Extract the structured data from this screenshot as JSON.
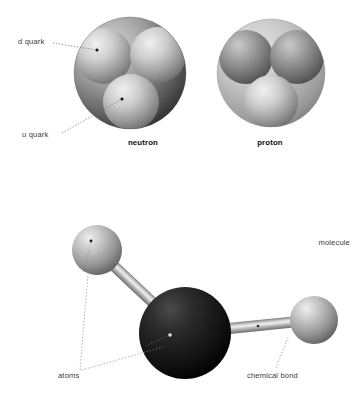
{
  "figure": {
    "background_color": "#ffffff",
    "label_color": "#3a3a3a"
  },
  "labels": {
    "d_quark": "d quark",
    "u_quark": "u quark",
    "neutron": "neutron",
    "proton": "proton",
    "molecule": "molecule",
    "atoms": "atoms",
    "chemical_bond": "chemical bond"
  },
  "diagram_data": {
    "type": "illustration",
    "panels": [
      {
        "name": "neutron",
        "caption": "neutron",
        "shell": {
          "cx": 130,
          "cy": 73,
          "r": 56,
          "fill": "#8f8f8f"
        },
        "quarks": [
          {
            "label": "d quark",
            "cx": 104,
            "cy": 56,
            "r": 27,
            "shade": "light"
          },
          {
            "label": "d quark",
            "cx": 157,
            "cy": 55,
            "r": 27,
            "shade": "light"
          },
          {
            "label": "u quark",
            "cx": 131,
            "cy": 101,
            "r": 27,
            "shade": "light"
          }
        ],
        "callouts": [
          {
            "text": "d quark",
            "dot": [
              97,
              50
            ]
          },
          {
            "text": "u quark",
            "dot": [
              122,
              99
            ]
          }
        ]
      },
      {
        "name": "proton",
        "caption": "proton",
        "shell": {
          "cx": 271,
          "cy": 73,
          "r": 54,
          "fill": "#a5a5a5"
        },
        "quarks": [
          {
            "label": "u quark",
            "cx": 246,
            "cy": 56,
            "r": 26,
            "shade": "dark"
          },
          {
            "label": "u quark",
            "cx": 297,
            "cy": 56,
            "r": 26,
            "shade": "dark"
          },
          {
            "label": "d quark",
            "cx": 271,
            "cy": 101,
            "r": 26,
            "shade": "light"
          }
        ],
        "callouts": []
      },
      {
        "name": "molecule",
        "caption": "molecule",
        "atoms": [
          {
            "cx": 97,
            "cy": 250,
            "r": 25,
            "shade": "gray",
            "marker": [
              91,
              241
            ]
          },
          {
            "cx": 185,
            "cy": 333,
            "r": 46,
            "shade": "black",
            "marker": [
              170,
              335
            ]
          },
          {
            "cx": 314,
            "cy": 320,
            "r": 24,
            "shade": "gray",
            "marker": null
          }
        ],
        "bonds": [
          {
            "from": [
              97,
              250
            ],
            "to": [
              185,
              333
            ],
            "width": 11
          },
          {
            "from": [
              185,
              333
            ],
            "to": [
              314,
              320
            ],
            "width": 11,
            "marker": [
              258,
              326
            ]
          }
        ],
        "callouts": [
          {
            "text": "atoms",
            "targets": [
              [
                90,
                272
              ],
              [
                163,
                346
              ]
            ]
          },
          {
            "text": "chemical bond",
            "targets": [
              [
                286,
                338
              ]
            ]
          }
        ]
      }
    ]
  }
}
